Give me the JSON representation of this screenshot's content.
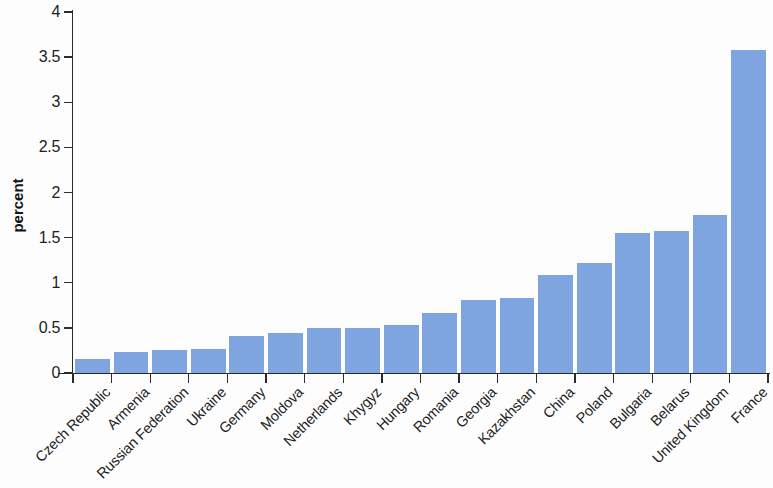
{
  "chart_data": {
    "type": "bar",
    "title": "",
    "subtitle": "",
    "xlabel": "",
    "ylabel": "percent",
    "ylim": [
      0,
      4
    ],
    "ytick_labels": [
      "0",
      "0.5",
      "1",
      "1.5",
      "2",
      "2.5",
      "3",
      "3.5",
      "4"
    ],
    "ytick_values": [
      0,
      0.5,
      1,
      1.5,
      2,
      2.5,
      3,
      3.5,
      4
    ],
    "grid": false,
    "legend": null,
    "bar_color": "#7fa5e0",
    "axis_color": "#2b2b2b",
    "categories": [
      "Czech Republic",
      "Armenia",
      "Russian Federation",
      "Ukraine",
      "Germany",
      "Moldova",
      "Netherlands",
      "Khygyz",
      "Hungary",
      "Romania",
      "Georgia",
      "Kazakhstan",
      "China",
      "Poland",
      "Bulgaria",
      "Belarus",
      "United Kingdom",
      "France"
    ],
    "values": [
      0.15,
      0.23,
      0.25,
      0.27,
      0.41,
      0.44,
      0.5,
      0.5,
      0.53,
      0.66,
      0.81,
      0.83,
      1.09,
      1.22,
      1.55,
      1.57,
      1.75,
      3.58
    ]
  }
}
